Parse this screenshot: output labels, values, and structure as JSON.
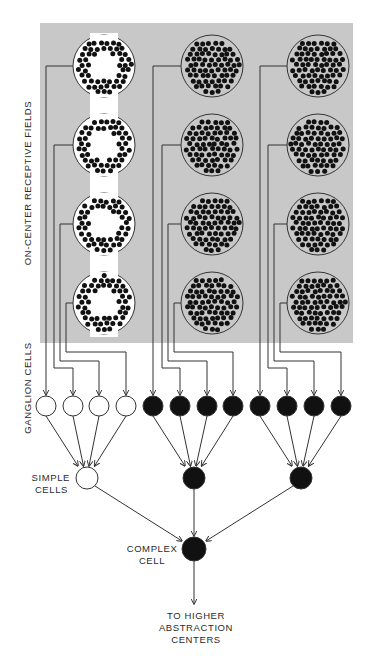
{
  "labels": {
    "receptive_fields": "ON-CENTER RECEPTIVE FIELDS",
    "ganglion_cells": "GANGLION CELLS",
    "simple_cells": [
      "SIMPLE",
      "CELLS"
    ],
    "complex_cell": [
      "COMPLEX",
      "CELL"
    ],
    "output": [
      "TO HIGHER",
      "ABSTRACTION",
      "CENTERS"
    ]
  },
  "colors": {
    "panel": "#c8c8c8",
    "stimulus_bar": "#ffffff",
    "dot": "#111111",
    "line": "#333333",
    "active_cell": "#111111",
    "inactive_cell": "#ffffff"
  },
  "receptive_field_columns": [
    {
      "column": "left",
      "fields": 4,
      "center_excited": true
    },
    {
      "column": "middle",
      "fields": 4,
      "center_excited": false
    },
    {
      "column": "right",
      "fields": 4,
      "center_excited": false
    }
  ],
  "ganglion_cells": [
    {
      "group": 1,
      "active": false
    },
    {
      "group": 1,
      "active": false
    },
    {
      "group": 1,
      "active": false
    },
    {
      "group": 1,
      "active": false
    },
    {
      "group": 2,
      "active": true
    },
    {
      "group": 2,
      "active": true
    },
    {
      "group": 2,
      "active": true
    },
    {
      "group": 2,
      "active": true
    },
    {
      "group": 3,
      "active": true
    },
    {
      "group": 3,
      "active": true
    },
    {
      "group": 3,
      "active": true
    },
    {
      "group": 3,
      "active": true
    }
  ],
  "simple_cells": [
    {
      "group": 1,
      "active": false
    },
    {
      "group": 2,
      "active": true
    },
    {
      "group": 3,
      "active": true
    }
  ],
  "complex_cell": {
    "active": true
  }
}
